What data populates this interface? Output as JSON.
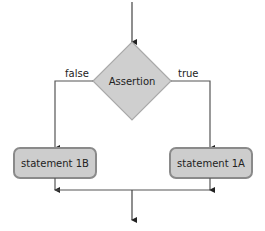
{
  "diagram": {
    "type": "flowchart",
    "decision": {
      "label": "Assertion",
      "fill": "#cfcfcf",
      "stroke": "#a9a9a9"
    },
    "branches": {
      "false_label": "false",
      "true_label": "true"
    },
    "statements": [
      {
        "id": "1B",
        "label": "statement 1B",
        "branch": "false"
      },
      {
        "id": "1A",
        "label": "statement 1A",
        "branch": "true"
      }
    ],
    "colors": {
      "box_fill": "#cdcdcd",
      "box_stroke": "#8a8a8a",
      "line": "#555555"
    }
  }
}
